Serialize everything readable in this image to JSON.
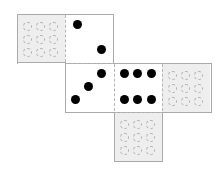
{
  "diagram": {
    "type": "cube-net",
    "cell_size_px": 48,
    "colors": {
      "blank_face": "#eeeeee",
      "visible_face": "#ffffff",
      "pip": "#000000",
      "ghost_pip": "#b0b0b0",
      "edge": "#aaaaaa"
    },
    "faces": [
      {
        "id": "top-left",
        "shown": false,
        "pips": null
      },
      {
        "id": "top",
        "shown": true,
        "pips": 2
      },
      {
        "id": "center",
        "shown": true,
        "pips": 3
      },
      {
        "id": "right",
        "shown": true,
        "pips": 6
      },
      {
        "id": "far-right",
        "shown": false,
        "pips": null
      },
      {
        "id": "bottom",
        "shown": false,
        "pips": null
      }
    ]
  }
}
